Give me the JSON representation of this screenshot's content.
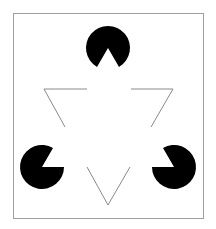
{
  "figure": {
    "name": "kanizsa-triangle",
    "background": "#ffffff",
    "border": {
      "x": 13,
      "y": 13,
      "width": 190,
      "height": 205,
      "color": "#a0a0a0"
    },
    "fill_color": "#000000",
    "line_color": "#8a8a8a",
    "inducers": [
      {
        "cx": 108,
        "cy": 48,
        "r": 22,
        "wedge": "down"
      },
      {
        "cx": 42,
        "cy": 167,
        "r": 22,
        "wedge": "up-right"
      },
      {
        "cx": 174,
        "cy": 167,
        "r": 22,
        "wedge": "up-left"
      }
    ],
    "outline_triangle_segments": [
      [
        87,
        89,
        44,
        89
      ],
      [
        44,
        89,
        65,
        127
      ],
      [
        131,
        89,
        173,
        89
      ],
      [
        173,
        89,
        151,
        127
      ],
      [
        87,
        167,
        108,
        205
      ],
      [
        108,
        205,
        130,
        167
      ]
    ]
  }
}
